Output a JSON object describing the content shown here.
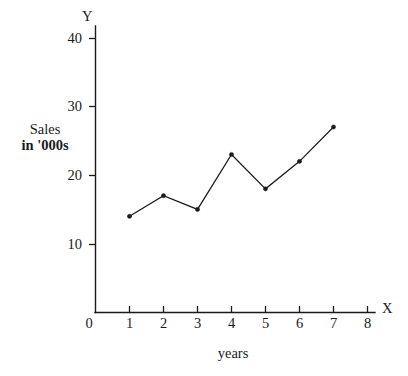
{
  "chart_data": {
    "type": "line",
    "title": "",
    "xlabel": "years",
    "ylabel_line1": "Sales",
    "ylabel_line2": "in '000s",
    "x_axis_name": "X",
    "y_axis_name": "Y",
    "x": [
      1,
      2,
      3,
      4,
      5,
      6,
      7
    ],
    "values": [
      14,
      17,
      15,
      23,
      18,
      22,
      27
    ],
    "series": [
      {
        "name": "Sales in '000s",
        "values": [
          14,
          17,
          15,
          23,
          18,
          22,
          27
        ]
      }
    ],
    "xlim": [
      0,
      8
    ],
    "ylim": [
      0,
      40
    ],
    "x_ticks": [
      "0",
      "1",
      "2",
      "3",
      "4",
      "5",
      "6",
      "7",
      "8"
    ],
    "y_ticks": [
      "10",
      "20",
      "30",
      "40"
    ],
    "grid": false,
    "legend": false,
    "marker": "filled-dot",
    "line_color": "#1a1a1a",
    "background_color": "#ffffff"
  },
  "axis": {
    "origin_label": "0",
    "x_name": "X",
    "y_name": "Y",
    "x_title": "years",
    "y_title_line1": "Sales",
    "y_title_line2": "in '000s"
  },
  "y_tick_labels": [
    "40",
    "30",
    "20",
    "10"
  ],
  "x_tick_labels": [
    "1",
    "2",
    "3",
    "4",
    "5",
    "6",
    "7",
    "8"
  ]
}
